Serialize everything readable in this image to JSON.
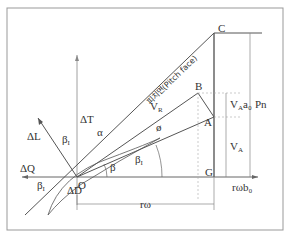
{
  "diagram": {
    "title": "",
    "pitch_face_label": "피치면(Pitch face)",
    "points": {
      "O": "O",
      "A": "A",
      "B": "B",
      "C": "C",
      "G": "G"
    },
    "vectors": {
      "dT": "ΔT",
      "dL": "ΔL",
      "dQ": "ΔQ",
      "dD": "ΔD",
      "VR": "V",
      "VR_sub": "R"
    },
    "angles": {
      "alpha": "α",
      "phi": "ø",
      "beta": "β",
      "beta_I": "β",
      "beta_I_sub": "I",
      "beta_1": "β",
      "beta_1_sub": "I"
    },
    "dimensions": {
      "r_omega": "rω",
      "r_omega_b0": "rωb₀",
      "VA": "V",
      "VA_sub": "A",
      "VAa0": "V",
      "VAa0_sub": "A",
      "VAa0_tail": "a₀",
      "Pn": "Pn"
    }
  }
}
